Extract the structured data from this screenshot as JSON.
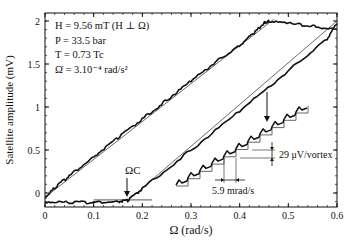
{
  "chart_data": {
    "type": "line",
    "title": "",
    "xlabel": "Ω (rad/s)",
    "ylabel": "Satellite amplitude (mV)",
    "xlim": [
      0,
      0.6
    ],
    "ylim": [
      -0.16,
      2.09
    ],
    "x_ticks": [
      "0",
      "0.1",
      "0.2",
      "0.3",
      "0.4",
      "0.5",
      "0.6"
    ],
    "y_ticks": [
      "0",
      "0.5",
      "1",
      "1.5",
      "2"
    ],
    "grid": false,
    "legend": null,
    "annotations": {
      "conditions": [
        "H = 9.56 mT  (H ⊥ Ω)",
        "P = 33.5 bar",
        "T = 0.73 Tc",
        "Ω̇ = 3.10⁻⁴ rad/s²"
      ],
      "omega_c_label": "ΩC",
      "omega_c_value": 0.17,
      "step_height_label": "29 μV/vortex",
      "step_width_label": "5.9 mrad/s"
    },
    "series": [
      {
        "name": "upper sweep (measured)",
        "x": [
          0.0,
          0.02,
          0.05,
          0.1,
          0.15,
          0.2,
          0.25,
          0.3,
          0.35,
          0.4,
          0.43,
          0.45,
          0.46,
          0.5,
          0.55,
          0.6
        ],
        "y": [
          -0.05,
          0.06,
          0.2,
          0.42,
          0.64,
          0.86,
          1.08,
          1.3,
          1.52,
          1.72,
          1.86,
          1.98,
          2.0,
          1.97,
          1.94,
          1.9
        ]
      },
      {
        "name": "upper sweep (fit line)",
        "x": [
          0.0,
          0.47
        ],
        "y": [
          -0.05,
          2.02
        ]
      },
      {
        "name": "lower sweep (measured)",
        "x": [
          0.0,
          0.05,
          0.1,
          0.15,
          0.17,
          0.2,
          0.3,
          0.4,
          0.5,
          0.58,
          0.6
        ],
        "y": [
          -0.1,
          -0.11,
          -0.11,
          -0.1,
          -0.09,
          0.05,
          0.5,
          0.95,
          1.42,
          1.8,
          1.97
        ]
      },
      {
        "name": "lower sweep (fit line)",
        "x": [
          0.17,
          0.6
        ],
        "y": [
          -0.09,
          2.0
        ]
      },
      {
        "name": "baseline reference",
        "x": [
          0.1,
          0.22
        ],
        "y": [
          -0.08,
          -0.08
        ]
      },
      {
        "name": "inset staircase (measured, zoomed)",
        "x": [
          0.27,
          0.3,
          0.33,
          0.36,
          0.39,
          0.42,
          0.45,
          0.48,
          0.51,
          0.535
        ],
        "y": [
          0.02,
          0.14,
          0.3,
          0.42,
          0.6,
          0.7,
          0.85,
          0.98,
          1.1,
          1.15
        ]
      }
    ]
  }
}
